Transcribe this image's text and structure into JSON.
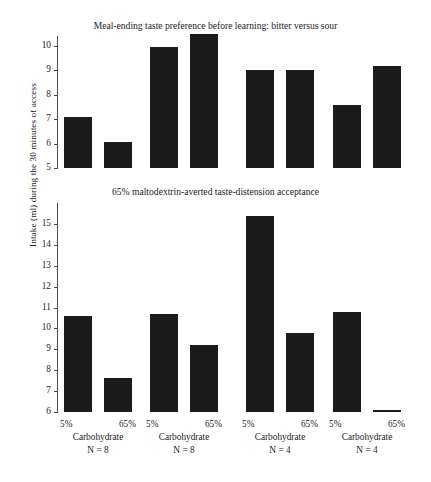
{
  "figure": {
    "ylabel": "Intake (ml) during the 30 minutes of access"
  },
  "panels": [
    {
      "title": "Meal-ending taste preference before learning: bitter versus sour",
      "yticks": [
        "10",
        "9",
        "8",
        "7",
        "6",
        "5"
      ]
    },
    {
      "title": "65% maltodextrin-averted taste-distension acceptance",
      "yticks": [
        "15",
        "14",
        "13",
        "12",
        "11",
        "10",
        "9",
        "8",
        "7",
        "6"
      ]
    }
  ],
  "xaxis": {
    "groups": [
      {
        "left": "5%",
        "right": "65%",
        "name": "Carbohydrate",
        "n": "N = 8"
      },
      {
        "left": "5%",
        "right": "65%",
        "name": "Carbohydrate",
        "n": "N = 8"
      },
      {
        "left": "5%",
        "right": "65%",
        "name": "Carbohydrate",
        "n": "N = 4"
      },
      {
        "left": "5%",
        "right": "65%",
        "name": "Carbohydrate",
        "n": "N = 4"
      }
    ]
  },
  "chart_data": [
    {
      "type": "bar",
      "title": "Meal-ending taste preference before learning: bitter versus sour",
      "xlabel": "Carbohydrate",
      "ylabel": "Intake (ml) during the 30 minutes of access",
      "ylim": [
        5,
        10.8
      ],
      "yticks": [
        5,
        6,
        7,
        8,
        9,
        10
      ],
      "grid": false,
      "legend": "none",
      "categories": [
        "5% / N = 8",
        "65% / N = 8",
        "5% / N = 8 (b)",
        "65% / N = 8 (b)",
        "5% / N = 4",
        "65% / N = 4",
        "5% / N = 4 (b)",
        "65% / N = 4 (b)"
      ],
      "values": [
        7.1,
        6.05,
        9.95,
        10.5,
        9.0,
        9.0,
        7.6,
        9.2
      ],
      "bar_color": "#1b1b1b"
    },
    {
      "type": "bar",
      "title": "65% maltodextrin-averted taste-distension acceptance",
      "xlabel": "Carbohydrate",
      "ylabel": "Intake (ml) during the 30 minutes of access",
      "ylim": [
        6,
        15.6
      ],
      "yticks": [
        6,
        7,
        8,
        9,
        10,
        11,
        12,
        13,
        14,
        15
      ],
      "grid": false,
      "legend": "none",
      "categories": [
        "5% / N = 8",
        "65% / N = 8",
        "5% / N = 8 (b)",
        "65% / N = 8 (b)",
        "5% / N = 4",
        "65% / N = 4",
        "5% / N = 4 (b)",
        "65% / N = 4 (b)"
      ],
      "values": [
        10.6,
        7.65,
        10.7,
        9.2,
        15.4,
        9.8,
        10.8,
        6.1
      ],
      "bar_color": "#1b1b1b"
    }
  ]
}
